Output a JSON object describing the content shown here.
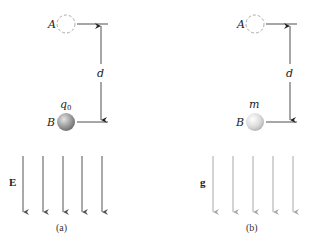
{
  "panels": [
    {
      "id": "a",
      "caption": "(a)",
      "point_a_label": "A",
      "point_b_label": "B",
      "distance_label": "d",
      "particle_label": "q",
      "particle_subscript": "0",
      "field_label": "E",
      "field_arrow_count": 5,
      "particle_color": "#9a9a9a",
      "field_color": "#555555"
    },
    {
      "id": "b",
      "caption": "(b)",
      "point_a_label": "A",
      "point_b_label": "B",
      "distance_label": "d",
      "particle_label": "m",
      "field_label": "g",
      "field_arrow_count": 5,
      "particle_color": "#d6d6d6",
      "field_color": "#a8a8a8"
    }
  ]
}
